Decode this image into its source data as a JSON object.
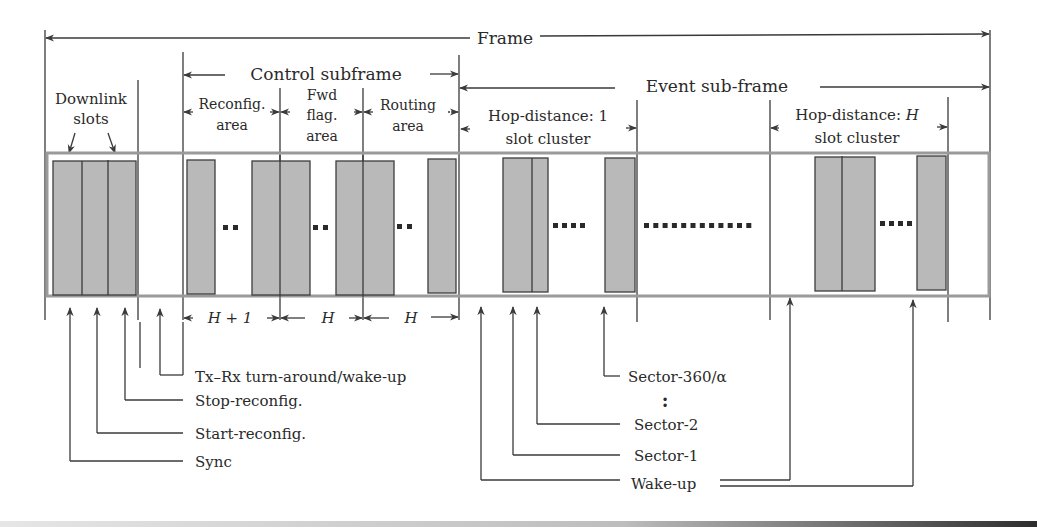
{
  "diagram": {
    "title_frame": "Frame",
    "control_subframe": "Control subframe",
    "event_subframe": "Event sub-frame",
    "downlink_slots": [
      "Downlink",
      "slots"
    ],
    "reconfig_area": [
      "Reconfig.",
      "area"
    ],
    "fwd_flag_area": [
      "Fwd",
      "flag.",
      "area"
    ],
    "routing_area": [
      "Routing",
      "area"
    ],
    "hop1_cluster": [
      "Hop-distance: 1",
      "slot cluster"
    ],
    "hopH_cluster": [
      "Hop-distance: ",
      "H",
      "slot cluster"
    ],
    "durations": {
      "reconfig": "H + 1",
      "fwd_flag": "H",
      "routing": "H"
    },
    "legend_left": {
      "tx_rx": "Tx–Rx turn-around/wake-up",
      "stop_reconfig": "Stop-reconfig.",
      "start_reconfig": "Start-reconfig.",
      "sync": "Sync"
    },
    "legend_right": {
      "sector_last": "Sector-360/α",
      "ellipsis": ":",
      "sector_2": "Sector-2",
      "sector_1": "Sector-1",
      "wake_up": "Wake-up"
    },
    "colors": {
      "slot_fill": "#b9b9b9",
      "band_border": "#9a9a9a",
      "line": "#3a3a3a"
    }
  }
}
